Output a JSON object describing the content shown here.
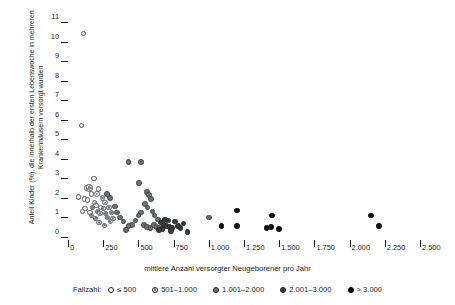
{
  "chart_data": {
    "type": "scatter",
    "title": "",
    "xlabel": "mittlere Anzahl versorgter Neugeborener pro Jahr",
    "ylabel": "Anteil Kinder (%), die innerhalb der ersten Lebenswoche in mehreren Krankenhäusern versorgt wurden",
    "xlim": [
      0,
      2500
    ],
    "ylim": [
      0,
      11
    ],
    "grid": false,
    "legend_position": "bottom",
    "legend_title": "Fallzahl:",
    "xticks": [
      0,
      250,
      500,
      750,
      1000,
      1250,
      1500,
      1750,
      2000,
      2250,
      2500
    ],
    "xticklabels": [
      "0",
      "250",
      "500",
      "750",
      "1.000",
      "1.250",
      "1.500",
      "1.750",
      "2.000",
      "2.250",
      "2.500"
    ],
    "yticks": [
      0,
      1,
      2,
      3,
      4,
      5,
      6,
      7,
      8,
      9,
      10,
      11
    ],
    "yticklabels": [
      "0",
      "1",
      "2",
      "3",
      "4",
      "5",
      "6",
      "7",
      "8",
      "9",
      "10",
      "11"
    ],
    "series": [
      {
        "name": "≤ 500",
        "class": "c0",
        "marker": "open-circle",
        "points": [
          [
            110,
            10.4
          ],
          [
            95,
            5.7
          ],
          [
            75,
            2.05
          ],
          [
            185,
            3.0
          ],
          [
            215,
            2.45
          ],
          [
            130,
            2.5
          ],
          [
            150,
            2.45
          ],
          [
            118,
            1.95
          ],
          [
            122,
            1.45
          ],
          [
            105,
            1.3
          ],
          [
            200,
            1.6
          ],
          [
            232,
            1.5
          ],
          [
            155,
            1.25
          ],
          [
            168,
            2.2
          ],
          [
            140,
            1.9
          ]
        ]
      },
      {
        "name": "501–1.000",
        "class": "c1",
        "marker": "circle-dot",
        "points": [
          [
            148,
            2.55
          ],
          [
            160,
            2.5
          ],
          [
            205,
            2.2
          ],
          [
            190,
            1.75
          ],
          [
            175,
            1.5
          ],
          [
            210,
            1.3
          ],
          [
            228,
            1.2
          ],
          [
            250,
            1.45
          ],
          [
            265,
            1.2
          ],
          [
            280,
            1.0
          ],
          [
            300,
            0.8
          ],
          [
            320,
            0.95
          ],
          [
            245,
            2.0
          ],
          [
            262,
            1.75
          ],
          [
            290,
            1.5
          ],
          [
            310,
            1.25
          ],
          [
            168,
            1.1
          ],
          [
            196,
            0.95
          ],
          [
            220,
            0.75
          ],
          [
            258,
            0.6
          ]
        ]
      },
      {
        "name": "1.001–2.000",
        "class": "c2",
        "marker": "filled-gray",
        "points": [
          [
            430,
            3.85
          ],
          [
            520,
            3.85
          ],
          [
            505,
            2.75
          ],
          [
            560,
            2.3
          ],
          [
            575,
            2.15
          ],
          [
            590,
            1.95
          ],
          [
            545,
            1.7
          ],
          [
            565,
            1.5
          ],
          [
            520,
            1.25
          ],
          [
            500,
            1.1
          ],
          [
            480,
            0.85
          ],
          [
            455,
            0.6
          ],
          [
            430,
            0.55
          ],
          [
            410,
            0.35
          ],
          [
            395,
            0.8
          ],
          [
            370,
            1.0
          ],
          [
            350,
            1.25
          ],
          [
            335,
            1.55
          ],
          [
            600,
            1.3
          ],
          [
            615,
            1.1
          ],
          [
            540,
            0.6
          ],
          [
            560,
            0.5
          ],
          [
            585,
            0.45
          ],
          [
            610,
            0.6
          ],
          [
            630,
            0.5
          ],
          [
            650,
            0.45
          ],
          [
            300,
            2.0
          ],
          [
            275,
            2.2
          ],
          [
            1000,
            1.0
          ],
          [
            640,
            0.9
          ]
        ]
      },
      {
        "name": "2.001–3.000",
        "class": "c3",
        "marker": "filled-dark",
        "points": [
          [
            660,
            0.75
          ],
          [
            680,
            0.6
          ],
          [
            700,
            0.55
          ],
          [
            720,
            0.5
          ],
          [
            740,
            0.45
          ],
          [
            690,
            0.9
          ],
          [
            710,
            0.85
          ],
          [
            760,
            0.8
          ],
          [
            780,
            0.55
          ],
          [
            800,
            0.45
          ],
          [
            670,
            0.4
          ],
          [
            730,
            0.3
          ],
          [
            850,
            0.25
          ],
          [
            820,
            0.7
          ],
          [
            645,
            0.35
          ]
        ]
      },
      {
        "name": "> 3.000",
        "class": "c4",
        "marker": "filled-black",
        "points": [
          [
            1200,
            1.35
          ],
          [
            1200,
            0.55
          ],
          [
            1450,
            1.1
          ],
          [
            1410,
            0.45
          ],
          [
            1440,
            0.5
          ],
          [
            1500,
            0.4
          ],
          [
            2150,
            1.1
          ],
          [
            2210,
            0.55
          ],
          [
            1090,
            0.55
          ]
        ]
      }
    ]
  },
  "axes": {
    "x_pixel_origin": 68,
    "x_pixel_end": 420,
    "y_pixel_zero": 237,
    "y_pixel_top": 22
  }
}
